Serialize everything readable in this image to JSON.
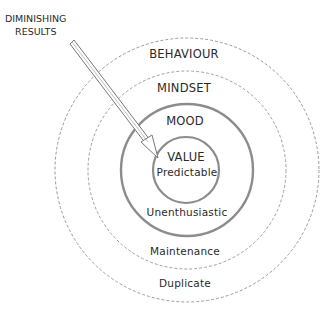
{
  "diagram": {
    "type": "concentric-circles",
    "center": {
      "x": 187,
      "y": 170
    },
    "rings": [
      {
        "id": "value",
        "radius": 33,
        "stroke": "#8a8a8a",
        "style": "solid",
        "width": 2.2
      },
      {
        "id": "mood",
        "radius": 66,
        "stroke": "#8a8a8a",
        "style": "solid",
        "width": 2.2
      },
      {
        "id": "mindset",
        "radius": 99,
        "stroke": "#9a9a9a",
        "style": "dashed",
        "width": 1
      },
      {
        "id": "behaviour",
        "radius": 132,
        "stroke": "#9a9a9a",
        "style": "dashed",
        "width": 1
      }
    ],
    "labels": {
      "behaviour": "BEHAVIOUR",
      "mindset": "MINDSET",
      "mood": "MOOD",
      "value": "VALUE",
      "predictable": "Predictable",
      "unenthusiastic": "Unenthusiastic",
      "maintenance": "Maintenance",
      "duplicate": "Duplicate"
    },
    "callout": {
      "line1": "DIMINISHING",
      "line2": "RESULTS"
    },
    "arrow": {
      "from": {
        "x": 72,
        "y": 42
      },
      "to": {
        "x": 158,
        "y": 157
      },
      "color": "#777777"
    }
  }
}
